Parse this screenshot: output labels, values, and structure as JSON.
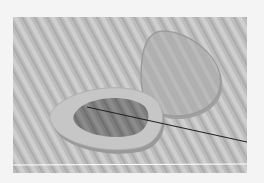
{
  "image": {
    "kind": "grayscale photograph",
    "subject": "two teardrop-shaped objects on a striped surface with a thin dark wire",
    "colors": {
      "page_background": "#f4f4f4",
      "surface": "#bdbdbd",
      "stripe_light": "#cfcfcf",
      "stripe_dark": "#acacac",
      "lid_fill": "#b3b3b3",
      "lid_rim": "#9c9c9c",
      "tray_rim": "#c6c6c6",
      "tray_shadow": "#999999",
      "tray_cavity": "#7e7e7e",
      "wire": "#222222",
      "bottom_line": "#ffffff"
    }
  }
}
